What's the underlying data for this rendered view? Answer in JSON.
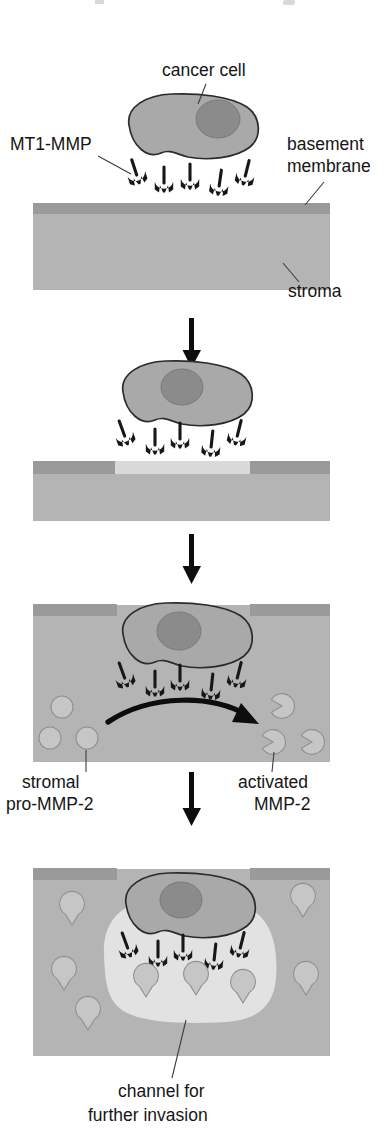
{
  "figure": {
    "width": 388,
    "height": 1145,
    "background": "#ffffff",
    "panel_count": 4
  },
  "labels": {
    "cancer_cell": "cancer cell",
    "mt1_mmp": "MT1-MMP",
    "basement_membrane_line1": "basement",
    "basement_membrane_line2": "membrane",
    "stroma": "stroma",
    "stromal_pro_mmp2_line1": "stromal",
    "stromal_pro_mmp2_line2": "pro-MMP-2",
    "activated_mmp2_line1": "activated",
    "activated_mmp2_line2": "MMP-2",
    "channel_line1": "channel for",
    "channel_line2": "further invasion"
  },
  "colors": {
    "background": "#ffffff",
    "basement_membrane": "#9a9a9a",
    "basement_membrane_degraded": "#d9d9d9",
    "stroma": "#b4b4b4",
    "cell_body": "#a9a9a9",
    "cell_nucleus": "#8b8b8b",
    "cell_outline": "#2b2b2b",
    "receptor": "#171717",
    "pro_mmp2": "#c6c6c6",
    "activated_mmp2": "#c6c6c6",
    "channel": "#e2e2e2",
    "arrow": "#0d0d0d",
    "text": "#151515",
    "leader_line": "#3d3d3d"
  },
  "panels": [
    {
      "id": "panel-1",
      "index": 1,
      "caption": "Cancer cell bearing MT1-MMP sits on an intact basement membrane over stroma",
      "basement_membrane_intact": true,
      "cell_position": "above-membrane",
      "receptor_count": 5,
      "pro_mmp2_count": 0,
      "activated_mmp2_count": 0
    },
    {
      "id": "panel-2",
      "index": 2,
      "caption": "MT1-MMP locally degrades a segment of the basement membrane",
      "basement_membrane_intact": false,
      "cell_position": "above-membrane",
      "receptor_count": 5,
      "pro_mmp2_count": 0,
      "activated_mmp2_count": 0
    },
    {
      "id": "panel-3",
      "index": 3,
      "caption": "Cell enters the breach; MT1-MMP converts stromal pro-MMP-2 into activated MMP-2",
      "basement_membrane_intact": false,
      "cell_position": "in-breach",
      "receptor_count": 5,
      "pro_mmp2_count": 3,
      "activated_mmp2_count": 3
    },
    {
      "id": "panel-4",
      "index": 4,
      "caption": "Activated MMP-2 clears a channel in the stroma for further invasion",
      "basement_membrane_intact": false,
      "cell_position": "inside-stroma",
      "receptor_count": 5,
      "pro_mmp2_count": 0,
      "activated_mmp2_count": 12,
      "channel_present": true
    }
  ],
  "connectors": [
    {
      "name": "arrow-panel1-to-panel2",
      "direction": "down",
      "from_panel": 1,
      "to_panel": 2
    },
    {
      "name": "arrow-panel2-to-panel3",
      "direction": "down",
      "from_panel": 2,
      "to_panel": 3
    },
    {
      "name": "arrow-panel3-to-panel4",
      "direction": "down",
      "from_panel": 3,
      "to_panel": 4
    },
    {
      "name": "arrow-pro-to-activated",
      "direction": "curved-right",
      "panel": 3,
      "meaning": "pro-MMP-2 converted to activated MMP-2"
    }
  ]
}
